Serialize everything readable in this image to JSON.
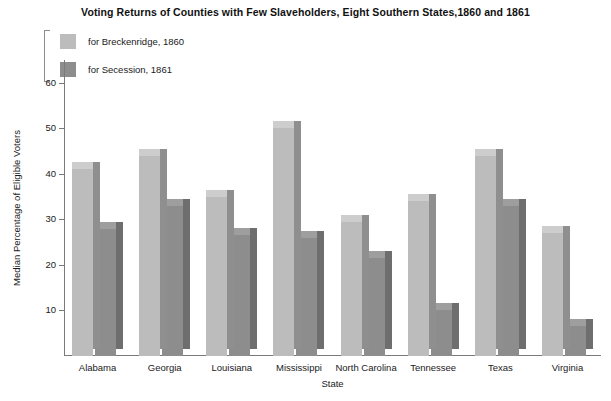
{
  "chart_data": {
    "type": "bar",
    "title": "Voting Returns of Counties with Few Slaveholders, Eight Southern States,1860 and 1861",
    "xlabel": "State",
    "ylabel": "Median Percentage of Eligible Voters",
    "categories": [
      "Alabama",
      "Georgia",
      "Louisiana",
      "Mississippi",
      "North Carolina",
      "Tennessee",
      "Texas",
      "Virginia"
    ],
    "series": [
      {
        "name": "for Breckenridge, 1860",
        "color": "#bcbcbc",
        "values": [
          41,
          44,
          35,
          50,
          29.5,
          34,
          44,
          27
        ]
      },
      {
        "name": "for Secession, 1861",
        "color": "#8d8d8d",
        "values": [
          28,
          33,
          26.5,
          26,
          21.5,
          10,
          33,
          6.5
        ]
      }
    ],
    "ylim": [
      0,
      65
    ],
    "yticks": [
      10,
      20,
      30,
      40,
      50,
      60
    ],
    "ytick_labels": [
      "10",
      "20",
      "30",
      "40",
      "50",
      "60"
    ],
    "grid": false,
    "legend_position": "top-left"
  }
}
